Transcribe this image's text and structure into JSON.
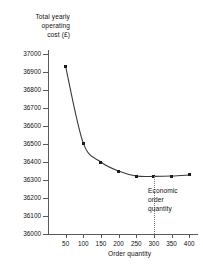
{
  "chart_data": {
    "type": "line",
    "title": "",
    "subtitle": "",
    "xlabel": "Order quantity",
    "ylabel": "Total yearly operating cost (£)",
    "x": [
      50,
      100,
      150,
      200,
      250,
      300,
      350,
      400
    ],
    "values": [
      36930,
      36505,
      36400,
      36350,
      36322,
      36320,
      36322,
      36328
    ],
    "series": [
      {
        "name": "Total yearly operating cost",
        "values": [
          36930,
          36505,
          36400,
          36350,
          36322,
          36320,
          36322,
          36328
        ]
      }
    ],
    "xlim": [
      0,
      425
    ],
    "ylim": [
      36000,
      37000
    ],
    "xticks": [
      50,
      100,
      150,
      200,
      250,
      300,
      350,
      400
    ],
    "yticks": [
      37000,
      36900,
      36800,
      36700,
      36600,
      36500,
      36400,
      36300,
      36200,
      36100,
      36000
    ],
    "xtick_labels": [
      "50",
      "100",
      "150",
      "200",
      "250",
      "300",
      "350",
      "400"
    ],
    "ytick_labels": [
      "37000",
      "36900",
      "36800",
      "36700",
      "36600",
      "36500",
      "36400",
      "36300",
      "36200",
      "36100",
      "36000"
    ],
    "grid": false,
    "legend": null,
    "marker": "square",
    "line_color": "#3a3a3a",
    "marker_color": "#1c1c1c",
    "axis_color": "#5a5a5a",
    "annotations": [
      {
        "name": "economic-order-quantity",
        "text": "Economic order quantity",
        "text_lines": [
          "Economic",
          "order",
          "quantity"
        ],
        "x_value": 300,
        "style": "vertical dotted line with label"
      }
    ]
  },
  "labels": {
    "y_axis_title_lines": [
      "Total yearly",
      "operating",
      "cost (£)"
    ],
    "x_axis_title": "Order quantity",
    "eoq_lines": [
      "Economic",
      "order",
      "quantity"
    ]
  }
}
